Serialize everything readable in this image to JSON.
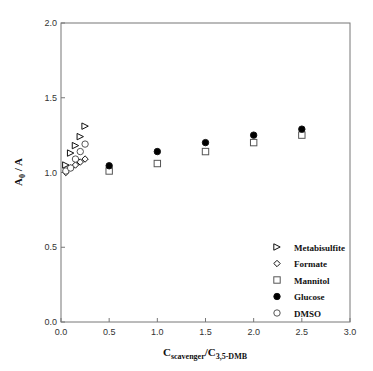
{
  "chart_data": {
    "type": "scatter",
    "title": "",
    "xlabel": "C_scavenger/C_3,5-DMB",
    "xlabel_main": "C",
    "xlabel_sub1": "scavenger",
    "xlabel_mid": "/C",
    "xlabel_sub2": "3,5-DMB",
    "ylabel": "A0 / A",
    "ylabel_main": "A",
    "ylabel_sub": "0",
    "ylabel_rest": " / A",
    "xlim": [
      0.0,
      3.0
    ],
    "ylim": [
      0.0,
      2.0
    ],
    "xticks": [
      "0.0",
      "0.5",
      "1.0",
      "1.5",
      "2.0",
      "2.5",
      "3.0"
    ],
    "yticks": [
      "0.0",
      "0.5",
      "1.0",
      "1.5",
      "2.0"
    ],
    "grid": false,
    "legend_position": "lower right",
    "series": [
      {
        "name": "Metabisulfite",
        "marker": "triangle-right-open",
        "x": [
          0.05,
          0.1,
          0.15,
          0.2,
          0.25
        ],
        "y": [
          1.05,
          1.13,
          1.18,
          1.24,
          1.31
        ]
      },
      {
        "name": "Formate",
        "marker": "diamond-open",
        "x": [
          0.05,
          0.1,
          0.15,
          0.2,
          0.25
        ],
        "y": [
          1.0,
          1.03,
          1.05,
          1.07,
          1.09
        ]
      },
      {
        "name": "Mannitol",
        "marker": "square-open",
        "x": [
          0.5,
          1.0,
          1.5,
          2.0,
          2.5
        ],
        "y": [
          1.01,
          1.06,
          1.14,
          1.2,
          1.25
        ]
      },
      {
        "name": "Glucose",
        "marker": "circle-filled",
        "x": [
          0.5,
          1.0,
          1.5,
          2.0,
          2.5
        ],
        "y": [
          1.045,
          1.14,
          1.2,
          1.25,
          1.29
        ]
      },
      {
        "name": "DMSO",
        "marker": "circle-open",
        "x": [
          0.05,
          0.1,
          0.15,
          0.2,
          0.25
        ],
        "y": [
          1.01,
          1.03,
          1.09,
          1.14,
          1.19
        ]
      }
    ]
  },
  "legend": [
    "Metabisulfite",
    "Formate",
    "Mannitol",
    "Glucose",
    "DMSO"
  ]
}
